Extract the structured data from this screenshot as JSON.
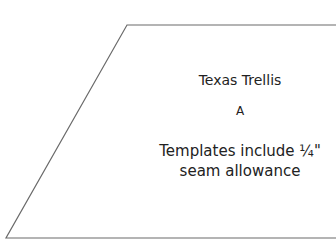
{
  "template": {
    "title": "Texas Trellis",
    "piece_label": "A",
    "note_line1": "Templates include ¼\"",
    "note_line2": "seam allowance"
  },
  "shape": {
    "type": "parallelogram",
    "stroke_color": "#666666",
    "fill_color": "#ffffff"
  }
}
